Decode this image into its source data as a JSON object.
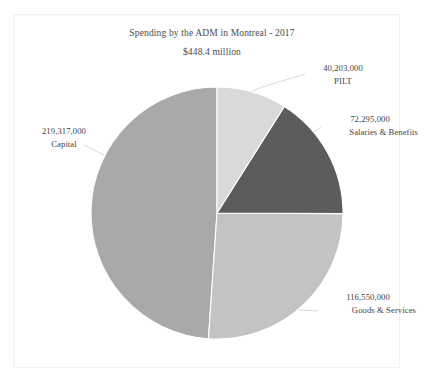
{
  "figure": {
    "title": "Spending by the ADM in Montreal - 2017",
    "subtitle": "$448.4 million"
  },
  "chart_data": {
    "type": "pie",
    "title": "Spending by the ADM in Montreal - 2017",
    "subtitle": "$448.4 million",
    "xlabel": "",
    "ylabel": "",
    "grid": false,
    "legend_position": "none",
    "label_style": "outside-with-leader-lines",
    "total_value": 448365000,
    "total_label": "$448.4 million",
    "units": "dollars",
    "start_angle_deg": 0,
    "direction": "clockwise",
    "categories": [
      "PILT",
      "Salaries & Benefits",
      "Goods & Services",
      "Capital"
    ],
    "values": [
      40203000,
      72295000,
      116550000,
      219317000
    ],
    "value_labels": [
      "40,203,000",
      "72,295,000",
      "116,550,000",
      "219,317,000"
    ],
    "percentages": [
      8.97,
      16.12,
      26.0,
      48.91
    ],
    "colors": [
      "#d9d9d9",
      "#5c5c5c",
      "#c3c3c3",
      "#a9a9a9"
    ],
    "slices": [
      {
        "name": "PILT",
        "value": 40203000,
        "value_label": "40,203,000",
        "percent": 8.97,
        "color": "#d9d9d9",
        "start_angle_deg": 0.0,
        "end_angle_deg": 32.3
      },
      {
        "name": "Salaries & Benefits",
        "value": 72295000,
        "value_label": "72,295,000",
        "percent": 16.12,
        "color": "#5c5c5c",
        "start_angle_deg": 32.3,
        "end_angle_deg": 90.3
      },
      {
        "name": "Goods & Services",
        "value": 116550000,
        "value_label": "116,550,000",
        "percent": 26.0,
        "color": "#c3c3c3",
        "start_angle_deg": 90.3,
        "end_angle_deg": 183.9
      },
      {
        "name": "Capital",
        "value": 219317000,
        "value_label": "219,317,000",
        "percent": 48.91,
        "color": "#a9a9a9",
        "start_angle_deg": 183.9,
        "end_angle_deg": 360.0
      }
    ]
  },
  "labels": {
    "pilt": {
      "value": "40,203,000",
      "name": "PILT"
    },
    "salaries": {
      "value": "72,295,000",
      "name": "Salaries & Benefits"
    },
    "capital": {
      "value": "219,317,000",
      "name": "Capital"
    },
    "goods": {
      "value": "116,550,000",
      "name": "Goods & Services"
    }
  }
}
